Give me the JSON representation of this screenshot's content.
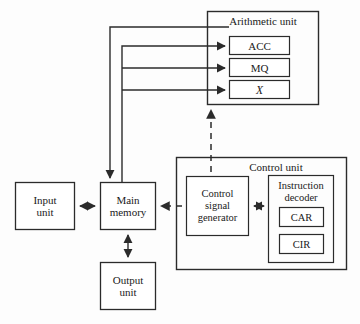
{
  "diagram": {
    "colors": {
      "stroke": "#2b2b2b",
      "background": "#fdfdfd",
      "text": "#1a1a1a"
    },
    "groups": [
      {
        "id": "arithmetic-unit",
        "label": "Arithmetic unit",
        "x": 207,
        "y": 11,
        "w": 112,
        "h": 94,
        "label_x": 207,
        "label_y": 15,
        "label_w": 112,
        "font_size": 11
      },
      {
        "id": "control-unit",
        "label": "Control unit",
        "x": 176,
        "y": 157,
        "w": 171,
        "h": 113,
        "label_x": 205,
        "label_y": 161,
        "label_w": 142,
        "font_size": 11
      },
      {
        "id": "instruction-decoder",
        "label": "Instruction\ndecoder",
        "x": 268,
        "y": 175,
        "w": 66,
        "h": 88,
        "label_x": 268,
        "label_y": 179,
        "label_w": 66,
        "font_size": 10.5
      }
    ],
    "boxes": [
      {
        "id": "acc",
        "label": "ACC",
        "x": 229,
        "y": 36,
        "w": 61,
        "h": 19,
        "font_size": 11,
        "italic": false
      },
      {
        "id": "mq",
        "label": "MQ",
        "x": 229,
        "y": 58,
        "w": 61,
        "h": 19,
        "font_size": 11,
        "italic": false
      },
      {
        "id": "x-register",
        "label": "X",
        "x": 229,
        "y": 80,
        "w": 61,
        "h": 19,
        "font_size": 11,
        "italic": true
      },
      {
        "id": "input-unit",
        "label": "Input\nunit",
        "x": 15,
        "y": 182,
        "w": 60,
        "h": 48,
        "font_size": 11,
        "italic": false
      },
      {
        "id": "main-memory",
        "label": "Main\nmemory",
        "x": 100,
        "y": 182,
        "w": 56,
        "h": 48,
        "font_size": 11,
        "italic": false
      },
      {
        "id": "output-unit",
        "label": "Output\nunit",
        "x": 100,
        "y": 262,
        "w": 56,
        "h": 48,
        "font_size": 11,
        "italic": false
      },
      {
        "id": "control-signal-generator",
        "label": "Control\nsignal\ngenerator",
        "x": 186,
        "y": 176,
        "w": 63,
        "h": 60,
        "font_size": 10.5,
        "italic": false
      },
      {
        "id": "car",
        "label": "CAR",
        "x": 279,
        "y": 207,
        "w": 45,
        "h": 20,
        "font_size": 10.5,
        "italic": false
      },
      {
        "id": "cir",
        "label": "CIR",
        "x": 279,
        "y": 234,
        "w": 45,
        "h": 20,
        "font_size": 10.5,
        "italic": false
      }
    ],
    "connectors": [
      {
        "id": "acc-to-memory-bus",
        "kind": "solid-arrow",
        "description": "ACC output bus down into Main memory"
      },
      {
        "id": "memory-to-registers-bus",
        "kind": "solid-arrow",
        "description": "Main memory bus up and into ACC, MQ and X"
      },
      {
        "id": "control-to-arithmetic",
        "kind": "dashed-arrow",
        "description": "Control signal generator up to Arithmetic unit"
      },
      {
        "id": "control-to-memory",
        "kind": "dashed-arrow",
        "description": "Control signal generator left to Main memory"
      },
      {
        "id": "input-memory-link",
        "kind": "solid-double-arrow",
        "description": "Input unit to Main memory"
      },
      {
        "id": "memory-output-link",
        "kind": "solid-double-arrow",
        "description": "Main memory to Output unit"
      },
      {
        "id": "csg-decoder-link",
        "kind": "solid-double-arrow",
        "description": "Control signal generator to Instruction decoder"
      }
    ]
  }
}
